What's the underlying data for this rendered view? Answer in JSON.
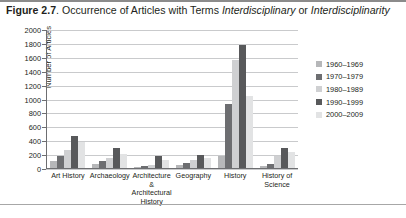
{
  "figure": {
    "label": "Figure 2.7",
    "caption_rest": ". Occurrence of Articles with Terms ",
    "term_1": "Interdisciplinary",
    "caption_or": " or ",
    "term_2": "Interdisciplinarity"
  },
  "colors": {
    "series": [
      "#b6b7b9",
      "#6d6e71",
      "#cfd0d2",
      "#58595b",
      "#e2e3e4"
    ],
    "gridline": "#c9cacc",
    "axis": "#6d6e71",
    "text": "#231f20"
  },
  "chart_data": {
    "type": "bar",
    "title": "Occurrence of Articles with Terms Interdisciplinary or Interdisciplinarity",
    "xlabel": "",
    "ylabel": "Number of Articles",
    "ylim": [
      0,
      2000
    ],
    "ytick_step": 200,
    "yticks": [
      0,
      200,
      400,
      600,
      800,
      1000,
      1200,
      1400,
      1600,
      1800,
      2000
    ],
    "grid": true,
    "legend_position": "right",
    "categories": [
      "Art History",
      "Archaeology",
      "Architecture & Architectural History",
      "Geography",
      "History",
      "History of Science"
    ],
    "series": [
      {
        "name": "1960–1969",
        "values": [
          100,
          60,
          20,
          40,
          180,
          30
        ]
      },
      {
        "name": "1970–1979",
        "values": [
          180,
          100,
          30,
          70,
          930,
          60
        ]
      },
      {
        "name": "1980–1989",
        "values": [
          260,
          150,
          50,
          110,
          1560,
          180
        ]
      },
      {
        "name": "1990–1999",
        "values": [
          470,
          290,
          170,
          190,
          1790,
          290
        ]
      },
      {
        "name": "2000–2009",
        "values": [
          370,
          200,
          110,
          150,
          1050,
          230
        ]
      }
    ]
  }
}
